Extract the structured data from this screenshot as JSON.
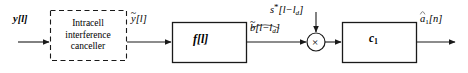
{
  "diagram": {
    "width": 468,
    "height": 73,
    "background_color": "#ffffff",
    "line_color": "#1a1a1a",
    "text_color": "#000000"
  },
  "signals": {
    "input": {
      "id": "y",
      "base": "y",
      "index": "[l]",
      "full": "y[l]"
    },
    "cancelled": {
      "id": "y-tilde",
      "base": "y",
      "accent": "tilde",
      "index": "[l]",
      "full": "ỹ[l]"
    },
    "equalized": {
      "id": "b-hat",
      "base": "b",
      "accent": "widehat",
      "index": "[l−l",
      "index_sub": "d",
      "index_close": "]",
      "full": "b̂[l−l_d]"
    },
    "conjugate_spread": {
      "id": "s-star",
      "base": "s",
      "star": "*",
      "index": "[l−l",
      "index_sub": "d",
      "index_close": "]",
      "full": "s*[l−l_d]"
    },
    "output": {
      "id": "a-hat-1",
      "base": "a",
      "accent": "hat",
      "sub": "1",
      "index": "[n]",
      "full": "â₁[n]"
    }
  },
  "blocks": {
    "canceller": {
      "shape": "dashed-rectangle",
      "lines": [
        "Intracell",
        "interference",
        "canceller"
      ],
      "x": 50,
      "y": 10,
      "width": 76,
      "height": 50
    },
    "filter_f": {
      "shape": "rectangle",
      "label": "f[l]",
      "label_base": "f",
      "label_index": "[l]",
      "x": 172,
      "y": 22,
      "width": 74,
      "height": 40
    },
    "combiner_c1": {
      "shape": "rectangle",
      "label": "c₁",
      "label_base": "c",
      "label_sub": "1",
      "x": 342,
      "y": 22,
      "width": 74,
      "height": 40
    },
    "multiplier": {
      "shape": "circle",
      "glyph": "×",
      "cx": 316,
      "cy": 42,
      "r": 9
    }
  },
  "connections": [
    {
      "from": "input",
      "to": "canceller",
      "type": "arrow"
    },
    {
      "from": "canceller",
      "to": "filter_f",
      "type": "arrow"
    },
    {
      "from": "filter_f",
      "to": "multiplier",
      "type": "arrow"
    },
    {
      "from": "conjugate_spread",
      "to": "multiplier",
      "type": "arrow-vertical"
    },
    {
      "from": "multiplier",
      "to": "combiner_c1",
      "type": "arrow"
    },
    {
      "from": "combiner_c1",
      "to": "output",
      "type": "arrow"
    }
  ]
}
